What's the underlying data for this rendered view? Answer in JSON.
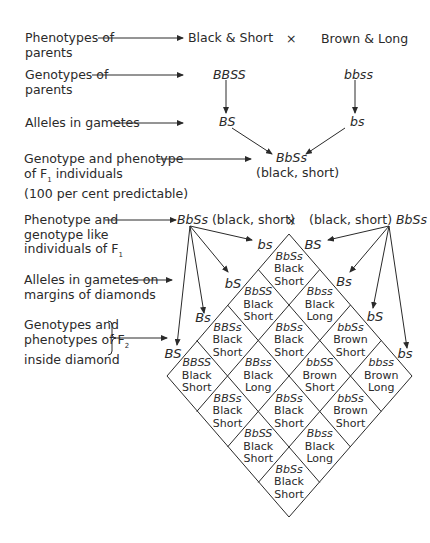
{
  "left_labels": {
    "phenotypes_parents": [
      "Phenotypes of",
      "parents"
    ],
    "genotypes_parents": [
      "Genotypes of",
      "parents"
    ],
    "alleles_gametes": "Alleles in gametes",
    "f1": [
      "Genotype and phenotype",
      "of F",
      "individuals",
      "(100 per cent predictable)"
    ],
    "f1_like": [
      "Phenotype and",
      "genotype like",
      "individuals of F"
    ],
    "alleles_margins": [
      "Alleles in gametes on",
      "margins of diamonds"
    ],
    "f2": [
      "Genotypes and",
      "phenotypes of F",
      "inside diamond"
    ],
    "subscript_1": "1",
    "subscript_2": "2"
  },
  "parents": {
    "p1_phenotype": "Black & Short",
    "p2_phenotype": "Brown & Long",
    "cross": "×",
    "p1_genotype": "BBSS",
    "p2_genotype": "bbss",
    "p1_gamete": "BS",
    "p2_gamete": "bs"
  },
  "f1": {
    "genotype": "BbSs",
    "phenotype": "(black, short)"
  },
  "f1_cross": {
    "left_genotype": "BbSs",
    "left_phenotype": "(black, short)",
    "cross": "×",
    "right_phenotype": "(black, short)",
    "right_genotype": "BbSs"
  },
  "gametes_left_edge": [
    "bs",
    "bS",
    "Bs",
    "BS"
  ],
  "gametes_right_edge": [
    "BS",
    "Bs",
    "bS",
    "bs"
  ],
  "f2_cells": [
    {
      "row": 0,
      "col": 0,
      "genotype": "BbSs",
      "color": "Black",
      "length": "Short"
    },
    {
      "row": 0,
      "col": 1,
      "genotype": "Bbss",
      "color": "Black",
      "length": "Long"
    },
    {
      "row": 0,
      "col": 2,
      "genotype": "bbSs",
      "color": "Brown",
      "length": "Short"
    },
    {
      "row": 0,
      "col": 3,
      "genotype": "bbss",
      "color": "Brown",
      "length": "Long"
    },
    {
      "row": 1,
      "col": 0,
      "genotype": "BbSS",
      "color": "Black",
      "length": "Short"
    },
    {
      "row": 1,
      "col": 1,
      "genotype": "BbSs",
      "color": "Black",
      "length": "Short"
    },
    {
      "row": 1,
      "col": 2,
      "genotype": "bbSS",
      "color": "Brown",
      "length": "Short"
    },
    {
      "row": 1,
      "col": 3,
      "genotype": "bbSs",
      "color": "Brown",
      "length": "Short"
    },
    {
      "row": 2,
      "col": 0,
      "genotype": "BBSs",
      "color": "Black",
      "length": "Short"
    },
    {
      "row": 2,
      "col": 1,
      "genotype": "BBss",
      "color": "Black",
      "length": "Long"
    },
    {
      "row": 2,
      "col": 2,
      "genotype": "BbSs",
      "color": "Black",
      "length": "Short"
    },
    {
      "row": 2,
      "col": 3,
      "genotype": "Bbss",
      "color": "Black",
      "length": "Long"
    },
    {
      "row": 3,
      "col": 0,
      "genotype": "BBSS",
      "color": "Black",
      "length": "Short"
    },
    {
      "row": 3,
      "col": 1,
      "genotype": "BBSs",
      "color": "Black",
      "length": "Short"
    },
    {
      "row": 3,
      "col": 2,
      "genotype": "BbSS",
      "color": "Black",
      "length": "Short"
    },
    {
      "row": 3,
      "col": 3,
      "genotype": "BbSs",
      "color": "Black",
      "length": "Short"
    }
  ],
  "colors": {
    "ink": "#2a2a2a",
    "background": "#ffffff"
  }
}
